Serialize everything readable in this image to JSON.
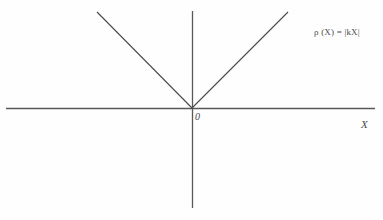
{
  "figure": {
    "background_color": "#fefefe",
    "line_color": "#4a4a4a",
    "axis_color": "#595959",
    "origin_label": "0",
    "xaxis_label": "X",
    "formula": "ρ (X) = |kX|",
    "formula_parts": {
      "rho": "ρ",
      "argument": "(X)",
      "equals": "=",
      "expression": "|kX|"
    }
  },
  "chart_data": {
    "type": "line",
    "title": "",
    "subtitle": "",
    "xlabel": "X",
    "ylabel": "",
    "grid": false,
    "legend": null,
    "annotations": [
      {
        "text": "0",
        "x": 0,
        "y": 0,
        "role": "origin-marker"
      },
      {
        "text": "X",
        "x": 1.93,
        "y": 0,
        "role": "axis-name"
      },
      {
        "text": "ρ (X) = |kX|",
        "x": 1.32,
        "y": 0.82,
        "role": "function-formula"
      }
    ],
    "axes": {
      "x_axis": {
        "visible": true,
        "x_start": -1.96,
        "x_end": 1.91,
        "y": 0,
        "ticks": []
      },
      "y_axis": {
        "visible": true,
        "y_start": -1.02,
        "y_end": 1.01,
        "x": 0,
        "ticks": []
      }
    },
    "xlim": [
      -1.96,
      1.91
    ],
    "ylim": [
      -1.02,
      1.01
    ],
    "series": [
      {
        "name": "ρ (X) = |kX|",
        "type": "line",
        "color": "#4a4a4a",
        "width": 1,
        "x": [
          -0.98,
          0,
          0.99
        ],
        "y": [
          1.0,
          0,
          1.0
        ]
      }
    ]
  },
  "geometry": {
    "x_axis": {
      "x1": 6,
      "y1": 108,
      "x2": 375,
      "y2": 108
    },
    "y_axis": {
      "x1": 192,
      "y1": 11,
      "x2": 192,
      "y2": 208
    },
    "v_left": {
      "x1": 97,
      "y1": 12,
      "x2": 192,
      "y2": 108
    },
    "v_right": {
      "x1": 192,
      "y1": 108,
      "x2": 288,
      "y2": 12
    }
  }
}
